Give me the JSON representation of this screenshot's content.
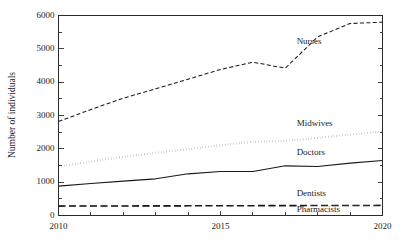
{
  "chart_data": {
    "type": "line",
    "title": "",
    "xlabel": "",
    "ylabel": "Number of individuals",
    "xlim": [
      2010,
      2020
    ],
    "ylim": [
      0,
      6000
    ],
    "grid": false,
    "legend_position": "inline-right-annotations",
    "x_major_ticks": [
      2010,
      2015,
      2020
    ],
    "x_major_tick_labels": [
      "2010",
      "2015",
      "2020"
    ],
    "x_minor_ticks": [
      2011,
      2012,
      2013,
      2014,
      2016,
      2017,
      2018,
      2019
    ],
    "y_major_ticks": [
      0,
      1000,
      2000,
      3000,
      4000,
      5000,
      6000
    ],
    "y_major_tick_labels": [
      "0",
      "1000",
      "2000",
      "3000",
      "4000",
      "5000",
      "6000"
    ],
    "y_minor_ticks": [
      500,
      1500,
      2500,
      3500,
      4500,
      5500
    ],
    "x": [
      2010,
      2011,
      2012,
      2013,
      2014,
      2015,
      2016,
      2017,
      2018,
      2019,
      2020
    ],
    "series": [
      {
        "name": "Nurses",
        "style": "dashed",
        "color": "#1a1a1a",
        "values": [
          2820,
          3180,
          3520,
          3800,
          4090,
          4380,
          4600,
          4420,
          5360,
          5760,
          5800
        ]
      },
      {
        "name": "Midwives",
        "style": "dotted",
        "color": "#1a1a1a",
        "values": [
          1470,
          1620,
          1760,
          1880,
          1990,
          2110,
          2210,
          2240,
          2330,
          2430,
          2520
        ]
      },
      {
        "name": "Doctors",
        "style": "solid",
        "color": "#1a1a1a",
        "values": [
          880,
          960,
          1030,
          1100,
          1250,
          1320,
          1320,
          1490,
          1470,
          1570,
          1650
        ]
      },
      {
        "name": "Dentists",
        "style": "long-dashed",
        "color": "#1a1a1a",
        "values": [
          290,
          292,
          294,
          296,
          298,
          300,
          302,
          304,
          306,
          308,
          310
        ]
      },
      {
        "name": "Pharmacists",
        "style": "long-dashed",
        "color": "#1a1a1a",
        "values": [
          275,
          277,
          279,
          281,
          283,
          285,
          287,
          289,
          291,
          293,
          295
        ]
      }
    ],
    "annotations": [
      {
        "text": "Nurses",
        "x": 2017.35,
        "y": 5200
      },
      {
        "text": "Midwives",
        "x": 2017.35,
        "y": 2760
      },
      {
        "text": "Doctors",
        "x": 2017.35,
        "y": 1870
      },
      {
        "text": "Dentists",
        "x": 2017.35,
        "y": 640
      },
      {
        "text": "Pharmacists",
        "x": 2017.35,
        "y": 170
      }
    ]
  }
}
